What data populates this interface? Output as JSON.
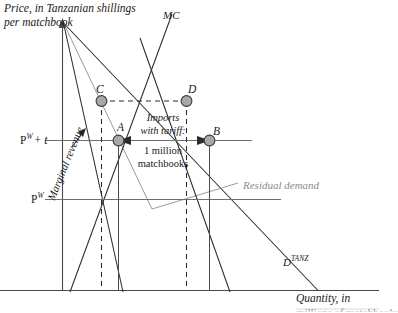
{
  "figure": {
    "type": "economics-diagram",
    "topic": "Monopoly with tariff: residual demand, marginal revenue and marginal cost",
    "y_axis_label_line1": "Price, in Tanzanian shillings",
    "y_axis_label_line2": "per matchbook",
    "x_axis_label_line1": "Quantity, in",
    "x_axis_label_line2": "millions of matchbooks"
  },
  "curves": [
    {
      "id": "mc",
      "label": "MC",
      "style": "solid-black"
    },
    {
      "id": "residual-demand",
      "label": "Residual demand",
      "style": "solid-gray"
    },
    {
      "id": "tanz-demand",
      "label": "D",
      "sup": "TANZ",
      "style": "solid-black"
    },
    {
      "id": "marginal-revenue",
      "label": "Marginal revenue",
      "style": "solid-black"
    }
  ],
  "price_lines": [
    {
      "id": "pw-plus-t",
      "label": "P",
      "sup": "W",
      "suffix": "+ t"
    },
    {
      "id": "pw",
      "label": "P",
      "sup": "W",
      "suffix": ""
    }
  ],
  "points": [
    {
      "id": "point-c",
      "label": "C"
    },
    {
      "id": "point-d",
      "label": "D"
    },
    {
      "id": "point-a",
      "label": "A"
    },
    {
      "id": "point-b",
      "label": "B"
    }
  ],
  "annotation": {
    "title_line1": "Imports",
    "title_line2": "with tariff:",
    "value_line1": "1 million",
    "value_line2": "matchbooks"
  },
  "colors": {
    "ink": "#1a1a1a",
    "gray": "#8c8c8c",
    "marker_fill": "#a8a8a8",
    "marker_stroke": "#3a3a3a",
    "background": "#ffffff"
  }
}
